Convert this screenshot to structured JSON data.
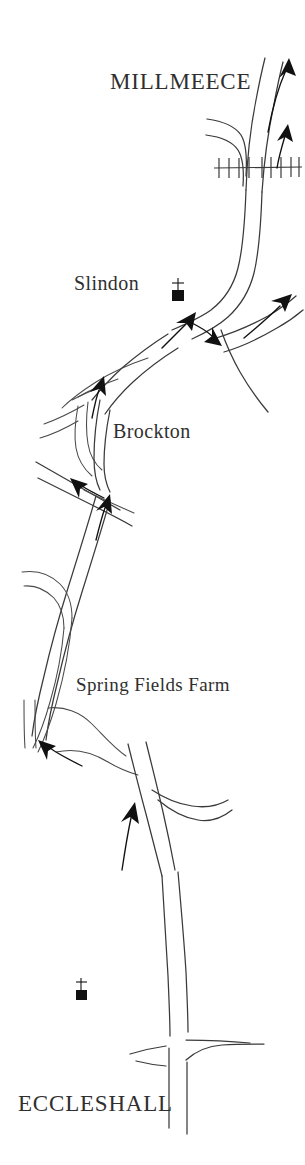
{
  "map": {
    "title": "Route map: Eccleshall to Millmeece",
    "orientation": "north-up",
    "background_color": "#ffffff",
    "ink_color": "#2f2f2f",
    "labels": [
      {
        "id": "millmeece",
        "text": "MILLMEECE",
        "style": "town-major",
        "x": 110,
        "y": 70
      },
      {
        "id": "slindon",
        "text": "Slindon",
        "style": "place",
        "x": 74,
        "y": 273
      },
      {
        "id": "brockton",
        "text": "Brockton",
        "style": "place",
        "x": 113,
        "y": 421
      },
      {
        "id": "springfields",
        "text": "Spring Fields Farm",
        "style": "farm",
        "x": 76,
        "y": 675
      },
      {
        "id": "eccleshall",
        "text": "ECCLESHALL",
        "style": "town-major",
        "x": 18,
        "y": 1092
      }
    ],
    "symbols": [
      {
        "id": "church-slindon",
        "name": "church-symbol",
        "x": 178,
        "y": 285
      },
      {
        "id": "church-eccleshall",
        "name": "church-symbol",
        "x": 80,
        "y": 985
      }
    ],
    "features": [
      {
        "id": "railway",
        "name": "railway-line",
        "description": "Railway crossing near Millmeece"
      },
      {
        "id": "junction-slindon",
        "name": "road-junction",
        "description": "Slindon crossroads"
      },
      {
        "id": "junction-brockton",
        "name": "road-junction",
        "description": "Brockton junction"
      },
      {
        "id": "junction-eccleshall",
        "name": "road-junction",
        "description": "Eccleshall crossroads"
      }
    ],
    "direction_arrows": [
      {
        "id": "arrow-millmeece-north-west",
        "heading": "north",
        "x": 268,
        "y": 72
      },
      {
        "id": "arrow-millmeece-north-east",
        "heading": "north",
        "x": 285,
        "y": 130
      },
      {
        "id": "arrow-slindon-northeast",
        "heading": "north-east",
        "x": 286,
        "y": 294
      },
      {
        "id": "arrow-slindon-northwest",
        "heading": "north-west",
        "x": 184,
        "y": 318
      },
      {
        "id": "arrow-slindon-southeast",
        "heading": "south-east",
        "x": 214,
        "y": 330
      },
      {
        "id": "arrow-brockton-north",
        "heading": "north",
        "x": 96,
        "y": 382
      },
      {
        "id": "arrow-brockton-northwest",
        "heading": "north-west",
        "x": 76,
        "y": 484
      },
      {
        "id": "arrow-brockton-north-lower",
        "heading": "north",
        "x": 102,
        "y": 502
      },
      {
        "id": "arrow-springfields-northwest",
        "heading": "north-west",
        "x": 42,
        "y": 744
      },
      {
        "id": "arrow-eccleshall-north",
        "heading": "north",
        "x": 131,
        "y": 808
      }
    ]
  }
}
